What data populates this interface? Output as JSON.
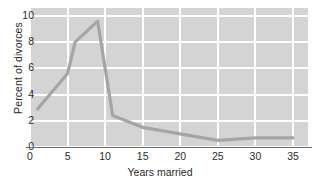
{
  "chart_data": {
    "type": "line",
    "title": "",
    "xlabel": "Years married",
    "ylabel": "Percent of divorces",
    "xlim": [
      0,
      37
    ],
    "ylim": [
      0,
      10.6
    ],
    "grid": true,
    "legend": "none",
    "x_ticks": [
      0,
      5,
      10,
      15,
      20,
      25,
      30,
      35
    ],
    "x_tick_labels": [
      "0",
      "5",
      "10",
      "15",
      "20",
      "25",
      "30",
      "35"
    ],
    "y_ticks": [
      0,
      2,
      4,
      6,
      8,
      10
    ],
    "y_tick_labels": [
      "0",
      "2",
      "4",
      "6",
      "8",
      "10"
    ],
    "series": [
      {
        "name": "Percent of divorces",
        "color": "#a5a5a5",
        "x": [
          1,
          5,
          6,
          9,
          11,
          15,
          20,
          25,
          30,
          35
        ],
        "values": [
          2.9,
          5.6,
          8.0,
          9.6,
          2.4,
          1.5,
          1.0,
          0.5,
          0.7,
          0.7
        ]
      }
    ]
  },
  "colors": {
    "plot_background": "#d4d4d4",
    "gridline": "#ffffff",
    "axis_line": "#6e6e6e",
    "series_line": "#a5a5a5",
    "text": "#2b2b2b",
    "page_background": "#ffffff"
  }
}
